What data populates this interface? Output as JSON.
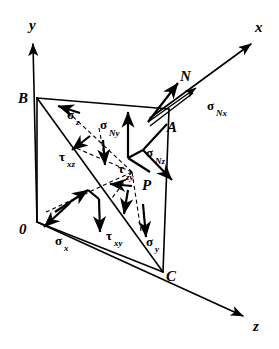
{
  "figure": {
    "background_color": "#ffffff",
    "ink_color": "#000000",
    "axes": [
      {
        "name": "y-axis",
        "label": "y",
        "direction": "up"
      },
      {
        "name": "x-axis",
        "label": "x",
        "direction": "up-right"
      },
      {
        "name": "z-axis",
        "label": "z",
        "direction": "down-right"
      }
    ],
    "points": [
      {
        "name": "origin",
        "label": "0"
      },
      {
        "name": "vertex-b",
        "label": "B"
      },
      {
        "name": "vertex-a",
        "label": "A"
      },
      {
        "name": "vertex-c",
        "label": "C"
      },
      {
        "name": "point-p",
        "label": "P"
      }
    ],
    "vectors": [
      {
        "name": "normal-vector",
        "label": "N"
      },
      {
        "name": "stress-sigma-Nx",
        "symbol": "σ",
        "sub": "Nx"
      },
      {
        "name": "stress-sigma-Ny",
        "symbol": "σ",
        "sub": "Ny"
      },
      {
        "name": "stress-sigma-Nz",
        "symbol": "σ",
        "sub": "Nz"
      },
      {
        "name": "stress-sigma-x",
        "symbol": "σ",
        "sub": "x"
      },
      {
        "name": "stress-sigma-y",
        "symbol": "σ",
        "sub": "y"
      },
      {
        "name": "stress-sigma-z",
        "symbol": "σ",
        "sub": "z"
      },
      {
        "name": "stress-tau-xy",
        "symbol": "τ",
        "sub": "xy"
      },
      {
        "name": "stress-tau-xz",
        "symbol": "τ",
        "sub": "xz"
      },
      {
        "name": "stress-tau-zy",
        "symbol": "τ",
        "sub": "zy"
      }
    ],
    "labels": {
      "axis_x": "x",
      "axis_y": "y",
      "axis_z": "z",
      "origin": "0",
      "point_b": "B",
      "point_a": "A",
      "point_c": "C",
      "point_p": "P",
      "normal": "N",
      "sigma": "σ",
      "tau": "τ",
      "sub_Nx": "Nx",
      "sub_Ny": "Ny",
      "sub_Nz": "Nz",
      "sub_x": "x",
      "sub_y": "y",
      "sub_z": "z",
      "sub_xy": "xy",
      "sub_xz": "xz",
      "sub_zy": "zy"
    }
  }
}
